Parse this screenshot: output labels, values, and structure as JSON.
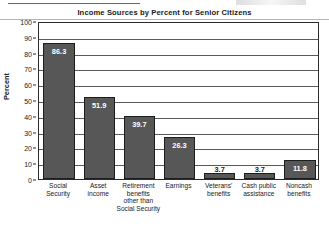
{
  "chart_data": {
    "type": "bar",
    "title": "Income Sources by Percent for Senior Citizens",
    "xlabel": "",
    "ylabel": "Percent",
    "ylim": [
      0,
      100
    ],
    "ytick_step": 10,
    "yticks": [
      100,
      90,
      80,
      70,
      60,
      50,
      40,
      30,
      20,
      10,
      0
    ],
    "grid": true,
    "legend": false,
    "categories": [
      "Social Security",
      "Asset income",
      "Retirement benefits other than Social Security",
      "Earnings",
      "Veterans' benefits",
      "Cash public assistance",
      "Noncash benefits"
    ],
    "category_lines": [
      [
        "Social",
        "Security"
      ],
      [
        "Asset",
        "income"
      ],
      [
        "Retirement",
        "benefits",
        "other than",
        "Social Security"
      ],
      [
        "Earnings"
      ],
      [
        "Veterans'",
        "benefits"
      ],
      [
        "Cash public",
        "assistance"
      ],
      [
        "Noncash",
        "benefits"
      ]
    ],
    "values": [
      86.3,
      51.9,
      39.7,
      26.3,
      3.7,
      3.7,
      11.8
    ],
    "value_labels": [
      "86.3",
      "51.9",
      "39.7",
      "26.3",
      "3.7",
      "3.7",
      "11.8"
    ],
    "bar_color": "#575757",
    "bar_edge_color": "#1d1d1d",
    "plot_border_color": "#2b2b2b",
    "gridline_color": "#5a5a5a",
    "text_color": "#1a1a1a"
  }
}
